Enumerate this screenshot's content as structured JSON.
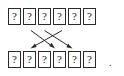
{
  "figure": {
    "kind": "permutation-diagram",
    "box_glyph": "?",
    "trailing_punctuation": ".",
    "colors": {
      "background": "#ffffff",
      "box_border": "#2b2b2b",
      "box_fill": "#ffffff",
      "glyph": "#1a1a1a",
      "arrow": "#2b2b2b"
    },
    "top_row": {
      "label": "top-row",
      "count": 6,
      "cells": [
        {
          "index": 1,
          "value": "?"
        },
        {
          "index": 2,
          "value": "?"
        },
        {
          "index": 3,
          "value": "?"
        },
        {
          "index": 4,
          "value": "?"
        },
        {
          "index": 5,
          "value": "?"
        },
        {
          "index": 6,
          "value": "?"
        }
      ]
    },
    "bottom_row": {
      "label": "bottom-row",
      "count": 6,
      "cells": [
        {
          "index": 1,
          "value": "?"
        },
        {
          "index": 2,
          "value": "?"
        },
        {
          "index": 3,
          "value": "?"
        },
        {
          "index": 4,
          "value": "?"
        },
        {
          "index": 5,
          "value": "?"
        },
        {
          "index": 6,
          "value": "?"
        }
      ]
    },
    "arrows": [
      {
        "id": "arrow-a",
        "from": "top-cell-2",
        "to": "bottom-cell-1",
        "x1": 31,
        "y1": 30,
        "x2": 55,
        "y2": 48
      },
      {
        "id": "arrow-b",
        "from": "top-cell-4",
        "to": "bottom-cell-2",
        "x1": 62,
        "y1": 30,
        "x2": 31,
        "y2": 48
      },
      {
        "id": "arrow-c",
        "from": "top-cell-3",
        "to": "bottom-cell-5",
        "x1": 45,
        "y1": 30,
        "x2": 72,
        "y2": 48
      }
    ]
  }
}
